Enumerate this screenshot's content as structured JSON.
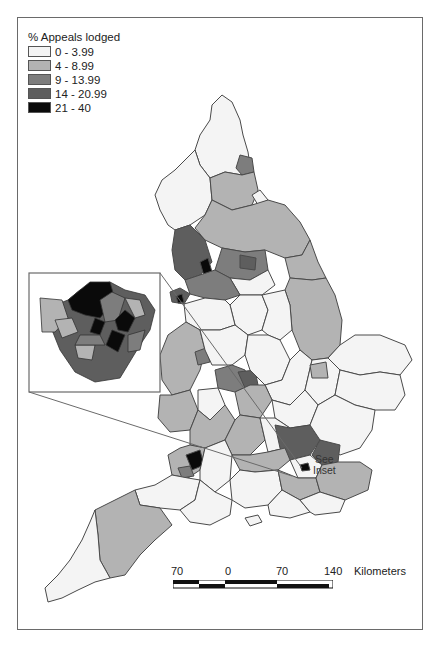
{
  "legend": {
    "title": "% Appeals lodged",
    "classes": [
      {
        "label": "0 - 3.99",
        "color": "#f4f4f4"
      },
      {
        "label": "4 - 8.99",
        "color": "#b3b3b3"
      },
      {
        "label": "9 - 13.99",
        "color": "#7d7d7d"
      },
      {
        "label": "14 - 20.99",
        "color": "#5e5e5e"
      },
      {
        "label": "21 - 40",
        "color": "#0a0a0a"
      }
    ]
  },
  "scale_bar": {
    "ticks": [
      "70",
      "0",
      "70",
      "140"
    ],
    "unit": "Kilometers"
  },
  "annotation": {
    "line1": "See",
    "line2": "Inset"
  },
  "map": {
    "subject": "England local authority districts",
    "inset_subject": "Greater London boroughs"
  }
}
